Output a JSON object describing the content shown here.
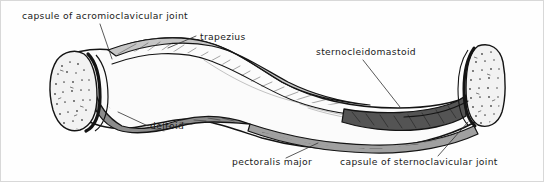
{
  "figure": {
    "canvas": {
      "width": 544,
      "height": 182
    },
    "background_color": "#fefefe",
    "border_color": "#d8d8d8"
  },
  "labels": [
    {
      "id": "capsule-acromioclavicular-joint",
      "text": "capsule of acromioclavicular joint",
      "x": 22,
      "y": 19
    },
    {
      "id": "trapezius",
      "text": "trapezius",
      "x": 200,
      "y": 40
    },
    {
      "id": "sternocleidomastoid",
      "text": "sternocleidomastoid",
      "x": 316,
      "y": 55
    },
    {
      "id": "deltoid",
      "text": "deltoid",
      "x": 150,
      "y": 129
    },
    {
      "id": "pectoralis-major",
      "text": "pectoralis major",
      "x": 232,
      "y": 165
    },
    {
      "id": "capsule-sternoclavicular-joint",
      "text": "capsule of sternoclavicular joint",
      "x": 340,
      "y": 165
    }
  ],
  "regions": {
    "trapezius_fill": "#c6c6c6",
    "deltoid_fill": "#8c8c8c",
    "sternocleidomastoid_fill": "#545454",
    "pectoralis_major_fill": "#a0a0a0",
    "bone_body_fill": "#fbfbfb",
    "capsule_fill": "#f2f2f2",
    "outline_color": "#141414"
  }
}
